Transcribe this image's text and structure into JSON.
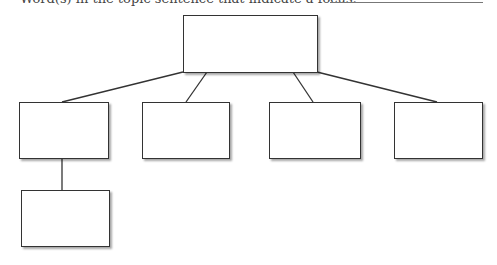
{
  "header": {
    "prompt": "Word(s) in the topic sentence that indicate a focus:",
    "answer_value": ""
  },
  "diagram": {
    "type": "tree",
    "stroke_color": "#333333",
    "nodes": [
      {
        "id": "root",
        "label": "",
        "x": 183,
        "y": 15,
        "w": 135,
        "h": 58
      },
      {
        "id": "child-1",
        "label": "",
        "x": 19,
        "y": 102,
        "w": 90,
        "h": 57
      },
      {
        "id": "child-2",
        "label": "",
        "x": 142,
        "y": 102,
        "w": 88,
        "h": 57
      },
      {
        "id": "child-3",
        "label": "",
        "x": 269,
        "y": 102,
        "w": 92,
        "h": 57
      },
      {
        "id": "child-4",
        "label": "",
        "x": 394,
        "y": 102,
        "w": 89,
        "h": 57
      },
      {
        "id": "grandchild-1",
        "label": "",
        "x": 21,
        "y": 190,
        "w": 89,
        "h": 57
      }
    ],
    "edges": [
      {
        "from": "root",
        "to": "child-1",
        "x1": 183,
        "y1": 72,
        "x2": 62,
        "y2": 102
      },
      {
        "from": "root",
        "to": "child-2",
        "x1": 207,
        "y1": 72,
        "x2": 186,
        "y2": 102
      },
      {
        "from": "root",
        "to": "child-3",
        "x1": 293,
        "y1": 72,
        "x2": 313,
        "y2": 102
      },
      {
        "from": "root",
        "to": "child-4",
        "x1": 317,
        "y1": 72,
        "x2": 437,
        "y2": 102
      },
      {
        "from": "child-1",
        "to": "grandchild-1",
        "x1": 62,
        "y1": 158,
        "x2": 62,
        "y2": 190
      }
    ]
  }
}
